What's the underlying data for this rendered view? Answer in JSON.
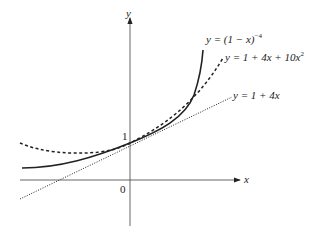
{
  "axes": {
    "x_label": "x",
    "y_label": "y",
    "origin_label": "0",
    "y_intercept_label": "1"
  },
  "curves": [
    {
      "name": "exact",
      "label": "y = (1 − x)",
      "exponent": "−4",
      "style": "solid"
    },
    {
      "name": "quadratic",
      "label": "y = 1 + 4x + 10x",
      "exponent": "2",
      "style": "dashed"
    },
    {
      "name": "linear",
      "label": "y = 1 + 4x",
      "style": "dotted"
    }
  ],
  "colors": {
    "line": "#222222",
    "axis": "#444444"
  }
}
